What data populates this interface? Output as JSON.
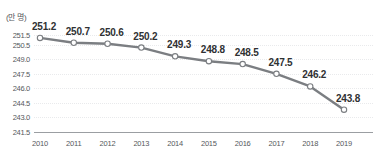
{
  "chart_data": {
    "type": "line",
    "title": "",
    "xlabel": "",
    "ylabel": "",
    "unit_label": "(만 명)",
    "categories": [
      "2010",
      "2011",
      "2012",
      "2013",
      "2014",
      "2015",
      "2016",
      "2017",
      "2018",
      "2019"
    ],
    "values": [
      251.2,
      250.7,
      250.6,
      250.2,
      249.3,
      248.8,
      248.5,
      247.5,
      246.2,
      243.8
    ],
    "data_labels": [
      "251.2",
      "250.7",
      "250.6",
      "250.2",
      "249.3",
      "248.8",
      "248.5",
      "247.5",
      "246.2",
      "243.8"
    ],
    "ylim": [
      241.5,
      252.0
    ],
    "y_ticks": [
      251.5,
      250.5,
      249.0,
      247.5,
      246.0,
      244.5,
      243.0,
      241.5
    ],
    "y_tick_labels": [
      "251.5",
      "250.5",
      "249.0",
      "247.5",
      "246.0",
      "244.5",
      "243.0",
      "241.5"
    ],
    "grid": true,
    "legend": "none",
    "series": [
      {
        "name": "",
        "values": [
          251.2,
          250.7,
          250.6,
          250.2,
          249.3,
          248.8,
          248.5,
          247.5,
          246.2,
          243.8
        ]
      }
    ],
    "colors": {
      "line": "#7b7e82",
      "marker_fill": "#ffffff",
      "marker_stroke": "#7b7e82",
      "gridline": "#e9eaec",
      "axis_line": "#9b9ea2",
      "tick_text": "#55585c",
      "data_label_text": "#2f3133",
      "background": "#ffffff"
    }
  }
}
